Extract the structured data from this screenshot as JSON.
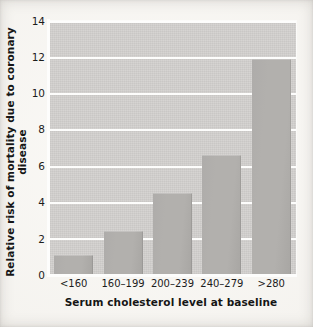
{
  "chart_data": {
    "type": "bar",
    "title": "",
    "xlabel": "Serum cholesterol level at baseline",
    "ylabel": "Relative risk of mortality due to coronary disease",
    "categories": [
      "<160",
      "160–199",
      "200–239",
      "240–279",
      ">280"
    ],
    "values": [
      1.1,
      2.4,
      4.5,
      6.6,
      11.9
    ],
    "series": [
      {
        "name": "Relative risk of mortality due to coronary disease",
        "values": [
          1.1,
          2.4,
          4.5,
          6.6,
          11.9
        ]
      }
    ],
    "ylim": [
      0,
      14
    ],
    "xlim_categories": 5,
    "yticks": [
      0,
      2,
      4,
      6,
      8,
      10,
      12,
      14
    ],
    "ytick_labels": [
      "0",
      "2",
      "4",
      "6",
      "8",
      "10",
      "12",
      "14"
    ],
    "grid": true,
    "grid_axis": "y",
    "grid_color": "#fdfdfc",
    "legend": false,
    "legend_position": "none",
    "annotations": [],
    "colors": {
      "bar_fill": "#b2b0ad",
      "plot_background": "#d2d0ce",
      "figure_background": "#f4f2ee",
      "axis_line": "#fdfdfc",
      "text": "#1c1c1c"
    }
  }
}
